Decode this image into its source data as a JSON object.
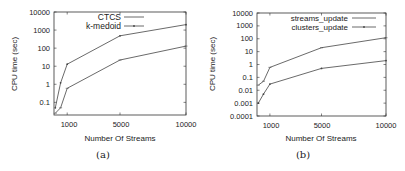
{
  "chart_data": [
    {
      "type": "line",
      "panel_label": "(a)",
      "xlabel": "Number Of Streams",
      "ylabel": "CPU time (sec)",
      "yscale": "log",
      "ylim": [
        0.02,
        10000
      ],
      "xlim": [
        0,
        10000
      ],
      "xticks": [
        "1000",
        "5000",
        "10000"
      ],
      "yticks": [
        "0.1",
        "1",
        "10",
        "100",
        "1000",
        "10000"
      ],
      "legend_position": "top-left inside",
      "x": [
        100,
        500,
        1000,
        5000,
        10000
      ],
      "series": [
        {
          "name": "CTCS",
          "values": [
            0.025,
            0.05,
            0.6,
            22,
            130
          ]
        },
        {
          "name": "k-medoid",
          "values": [
            0.05,
            1.2,
            13,
            480,
            2000
          ]
        }
      ]
    },
    {
      "type": "line",
      "panel_label": "(b)",
      "xlabel": "Number Of Streams",
      "ylabel": "CPU time (sec)",
      "yscale": "log",
      "ylim": [
        0.0001,
        10000
      ],
      "xlim": [
        0,
        10000
      ],
      "xticks": [
        "1000",
        "5000",
        "10000"
      ],
      "yticks": [
        "0.0001",
        "0.001",
        "0.01",
        "0.1",
        "1",
        "10",
        "100",
        "1000",
        "10000"
      ],
      "legend_position": "top-right inside",
      "x": [
        100,
        500,
        1000,
        5000,
        10000
      ],
      "series": [
        {
          "name": "streams_update",
          "values": [
            0.025,
            0.05,
            0.6,
            20,
            120
          ]
        },
        {
          "name": "clusters_update",
          "values": [
            0.001,
            0.005,
            0.03,
            0.5,
            2
          ]
        }
      ]
    }
  ],
  "panels": {
    "a": {
      "caption": "(a)",
      "xlabel": "Number Of Streams",
      "ylabel": "CPU time (sec)",
      "legend": [
        "CTCS",
        "k-medoid"
      ],
      "xticks": [
        "1000",
        "5000",
        "10000"
      ],
      "yticks": [
        "10000",
        "1000",
        "100",
        "10",
        "1",
        "0.1"
      ]
    },
    "b": {
      "caption": "(b)",
      "xlabel": "Number Of Streams",
      "ylabel": "CPU time (sec)",
      "legend": [
        "streams_update",
        "clusters_update"
      ],
      "xticks": [
        "1000",
        "5000",
        "10000"
      ],
      "yticks": [
        "10000",
        "1000",
        "100",
        "10",
        "1",
        "0.1",
        "0.01",
        "0.001",
        "0.0001"
      ]
    }
  },
  "colors": {
    "line": "#444444",
    "axis": "#333333",
    "text": "#222222"
  }
}
